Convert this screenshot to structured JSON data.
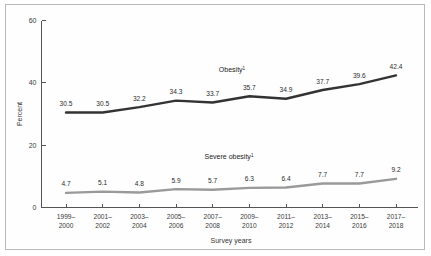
{
  "figure": {
    "percent_axis_title": "Percent",
    "survey_axis_title": "Survey years"
  },
  "chart_data": {
    "type": "line",
    "title": "",
    "xlabel": "Survey years",
    "ylabel": "Percent",
    "ylim": [
      0,
      60
    ],
    "yticks": [
      0,
      20,
      40,
      60
    ],
    "ytick_labels": [
      "0",
      "20",
      "40",
      "60"
    ],
    "grid": false,
    "legend": "inline-annotation",
    "categories": [
      "1999–2000",
      "2001–2002",
      "2003–2004",
      "2005–2006",
      "2007–2008",
      "2009–2010",
      "2011–2012",
      "2013–2014",
      "2015–2016",
      "2017–2018"
    ],
    "category_lines": [
      [
        "1999–",
        "2000"
      ],
      [
        "2001–",
        "2002"
      ],
      [
        "2003–",
        "2004"
      ],
      [
        "2005–",
        "2006"
      ],
      [
        "2007–",
        "2008"
      ],
      [
        "2009–",
        "2010"
      ],
      [
        "2011–",
        "2012"
      ],
      [
        "2013–",
        "2014"
      ],
      [
        "2015–",
        "2016"
      ],
      [
        "2017–",
        "2018"
      ]
    ],
    "series": [
      {
        "name": "Obesity",
        "footnote_marker": "1",
        "color": "#333333",
        "label_position": {
          "x": 232,
          "y": 72
        },
        "values": [
          30.5,
          30.5,
          32.2,
          34.3,
          33.7,
          35.7,
          34.9,
          37.7,
          39.6,
          42.4
        ],
        "value_labels": [
          "30.5",
          "30.5",
          "32.2",
          "34.3",
          "33.7",
          "35.7",
          "34.9",
          "37.7",
          "39.6",
          "42.4"
        ]
      },
      {
        "name": "Severe obesity",
        "footnote_marker": "1",
        "color": "#9a9a9a",
        "label_position": {
          "x": 229,
          "y": 159
        },
        "values": [
          4.7,
          5.1,
          4.8,
          5.9,
          5.7,
          6.3,
          6.4,
          7.7,
          7.7,
          9.2
        ],
        "value_labels": [
          "4.7",
          "5.1",
          "4.8",
          "5.9",
          "5.7",
          "6.3",
          "6.4",
          "7.7",
          "7.7",
          "9.2"
        ]
      }
    ]
  }
}
